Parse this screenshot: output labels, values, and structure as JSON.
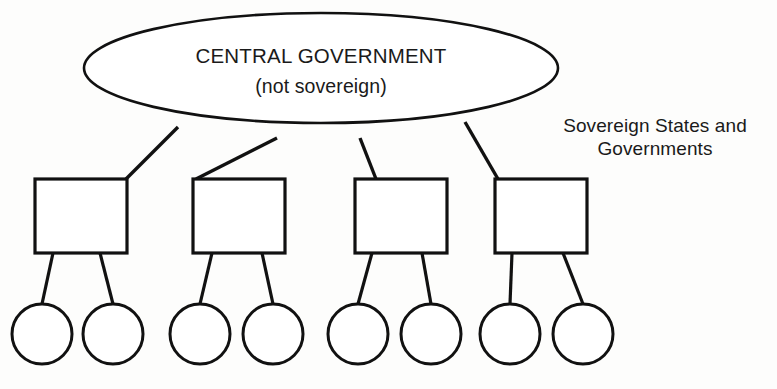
{
  "diagram": {
    "title": "CENTRAL GOVERNMENT",
    "subtitle": "(not sovereign)",
    "side_label_line1": "Sovereign States and",
    "side_label_line2": "Governments",
    "colors": {
      "background": "#fdfdfc",
      "stroke": "#111111",
      "shape_fill": "#ffffff",
      "text": "#1a1a1a"
    },
    "geometry": {
      "ellipse": {
        "cx": 321,
        "cy": 68,
        "rx": 237,
        "ry": 55,
        "stroke_width": 2.6
      },
      "title_y": 58,
      "subtitle_y": 88,
      "side_label_x": 655,
      "side_label_y1": 127,
      "side_label_y2": 150,
      "box_width": 92,
      "box_height": 74,
      "box_top": 179,
      "box_stroke_width": 3.2,
      "circle_radius": 30,
      "circle_cy": 334,
      "circle_stroke_width": 3.0,
      "trunk_stroke_width": 3.4,
      "leg_stroke_width": 3.2
    },
    "nodes": {
      "central": {
        "name": "central-government",
        "shape": "ellipse"
      },
      "states": [
        {
          "id": "state-1",
          "box_x": 35,
          "leg_left_x": 53,
          "leg_right_x": 100
        },
        {
          "id": "state-2",
          "box_x": 193,
          "leg_left_x": 212,
          "leg_right_x": 262
        },
        {
          "id": "state-3",
          "box_x": 355,
          "leg_left_x": 372,
          "leg_right_x": 422
        },
        {
          "id": "state-4",
          "box_x": 495,
          "leg_left_x": 512,
          "leg_right_x": 563
        }
      ],
      "circles": [
        {
          "id": "local-1",
          "cx": 42
        },
        {
          "id": "local-2",
          "cx": 113
        },
        {
          "id": "local-3",
          "cx": 200
        },
        {
          "id": "local-4",
          "cx": 273
        },
        {
          "id": "local-5",
          "cx": 358
        },
        {
          "id": "local-6",
          "cx": 431
        },
        {
          "id": "local-7",
          "cx": 510
        },
        {
          "id": "local-8",
          "cx": 583
        }
      ]
    },
    "trunk_connectors": [
      {
        "id": "trunk-1",
        "x1": 178,
        "y1": 127,
        "x2": 126,
        "y2": 179
      },
      {
        "id": "trunk-2",
        "x1": 277,
        "y1": 138,
        "x2": 196,
        "y2": 179
      },
      {
        "id": "trunk-3",
        "x1": 360,
        "y1": 138,
        "x2": 376,
        "y2": 179
      },
      {
        "id": "trunk-4",
        "x1": 465,
        "y1": 122,
        "x2": 498,
        "y2": 179
      }
    ]
  }
}
